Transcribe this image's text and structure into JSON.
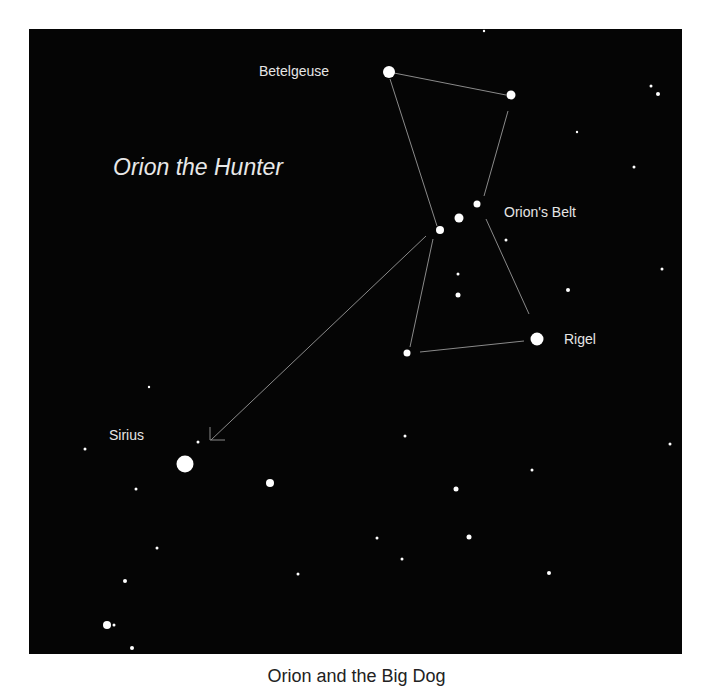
{
  "diagram": {
    "title": "Orion the Hunter",
    "background_color": "#050505",
    "line_color": "#8a8a8a",
    "star_color": "#ffffff",
    "labels": {
      "betelgeuse": "Betelgeuse",
      "belt": "Orion's Belt",
      "rigel": "Rigel",
      "sirius": "Sirius"
    },
    "caption": "Orion and the Big Dog"
  }
}
